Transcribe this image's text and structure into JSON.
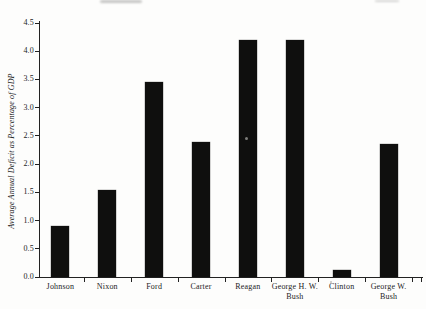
{
  "figure": {
    "paper_color": "#fdfdfc",
    "bar_color": "#0f0f0e",
    "axis_color": "#222222",
    "text_color": "#1c1c1c"
  },
  "chart_data": {
    "type": "bar",
    "ylabel": "Average Annual Deficit as Percentage of GDP",
    "xlabel": "",
    "categories": [
      "Johnson",
      "Nixon",
      "Ford",
      "Carter",
      "Reagan",
      "George H. W.\nBush",
      "Clinton",
      "George W.\nBush"
    ],
    "values": [
      0.9,
      1.55,
      3.45,
      2.4,
      4.2,
      4.2,
      0.12,
      2.35
    ],
    "ylim": [
      0,
      4.5
    ],
    "ytick_labels": [
      "0.0",
      "0.5",
      "1.0",
      "1.5",
      "2.0",
      "2.5",
      "3.0",
      "3.5",
      "4.0",
      "4.5"
    ],
    "grid": false,
    "legend": "none",
    "bar_style": "solid-black"
  }
}
